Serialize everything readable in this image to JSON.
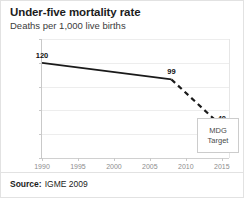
{
  "header": {
    "title": "Under-five mortality rate",
    "subtitle": "Deaths per 1,000 live births"
  },
  "footer": {
    "source_label": "Source:",
    "source_value": "IGME 2009"
  },
  "annotations": {
    "mdg_line1": "MDG",
    "mdg_line2": "Target"
  },
  "colors": {
    "line": "#1a1a1a",
    "grid": "#ededed",
    "axis": "#c9c9c9",
    "tick_text": "#8d8d8d",
    "title": "#1c1c1c",
    "card_border": "#e2e2e2"
  },
  "chart_data": {
    "type": "line",
    "title": "Under-five mortality rate",
    "subtitle": "Deaths per 1,000 live births",
    "xlabel": "",
    "ylabel": "Deaths per 1,000 live births",
    "xlim": [
      1990,
      2016
    ],
    "ylim": [
      0,
      150
    ],
    "yticks": [
      0,
      30,
      60,
      90,
      120,
      150
    ],
    "xticks": [
      1990,
      1995,
      2000,
      2005,
      2010,
      2015
    ],
    "grid": true,
    "legend": "none",
    "series": [
      {
        "name": "Observed",
        "style": "solid",
        "x": [
          1990,
          2008
        ],
        "values": [
          120,
          99
        ]
      },
      {
        "name": "Projected to MDG target",
        "style": "dashed",
        "x": [
          2008,
          2015
        ],
        "values": [
          99,
          40
        ]
      }
    ],
    "point_labels": [
      {
        "x": 1990,
        "value": 120,
        "text": "120"
      },
      {
        "x": 2008,
        "value": 99,
        "text": "99"
      },
      {
        "x": 2015,
        "value": 40,
        "text": "40"
      }
    ],
    "annotations": [
      {
        "text": "MDG Target",
        "x": 2014,
        "value": 25
      }
    ]
  }
}
